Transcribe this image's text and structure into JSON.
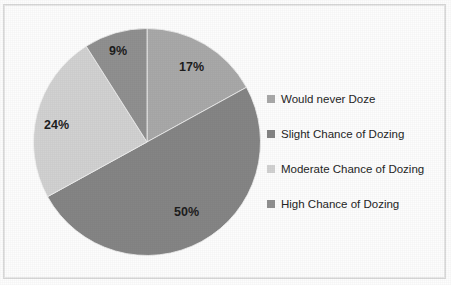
{
  "chart_data": {
    "type": "pie",
    "title": "",
    "subtitle": "",
    "xlabel": "",
    "ylabel": "",
    "grid": false,
    "legend_position": "right",
    "start_angle_deg": 0,
    "direction": "clockwise",
    "categories": [
      "Would never Doze",
      "Slight Chance of Dozing",
      "Moderate Chance of Dozing",
      "High Chance of Dozing"
    ],
    "values": [
      17,
      50,
      24,
      9
    ],
    "value_labels": [
      "17%",
      "50%",
      "24%",
      "9%"
    ],
    "colors": [
      "#a9a9a9",
      "#858585",
      "#d2d2d2",
      "#909090"
    ],
    "slices": [
      {
        "label": "Would never Doze",
        "value": 17,
        "display": "17%",
        "color": "#a9a9a9"
      },
      {
        "label": "Slight Chance of Dozing",
        "value": 50,
        "display": "50%",
        "color": "#858585"
      },
      {
        "label": "Moderate Chance of Dozing",
        "value": 24,
        "display": "24%",
        "color": "#d2d2d2"
      },
      {
        "label": "High Chance of Dozing",
        "value": 9,
        "display": "9%",
        "color": "#909090"
      }
    ]
  },
  "labels": {
    "never": "17%",
    "slight": "50%",
    "moderate": "24%",
    "high": "9%"
  },
  "legend": {
    "items": [
      {
        "label": "Would never Doze",
        "color": "#a9a9a9"
      },
      {
        "label": "Slight Chance of Dozing",
        "color": "#858585"
      },
      {
        "label": "Moderate Chance of Dozing",
        "color": "#d2d2d2"
      },
      {
        "label": "High Chance of Dozing",
        "color": "#909090"
      }
    ]
  }
}
